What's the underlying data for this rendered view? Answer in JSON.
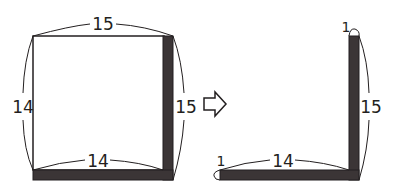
{
  "colors": {
    "ink": "#231f20",
    "strip": "#3b3536",
    "background": "#ffffff"
  },
  "before": {
    "top_label": "15",
    "left_label": "14",
    "right_label": "15",
    "bottom_label": "14"
  },
  "arrow": {
    "icon": "outlined-right-arrow"
  },
  "after": {
    "top_thickness_label": "1",
    "vertical_label": "15",
    "left_thickness_label": "1",
    "horizontal_label": "14"
  }
}
